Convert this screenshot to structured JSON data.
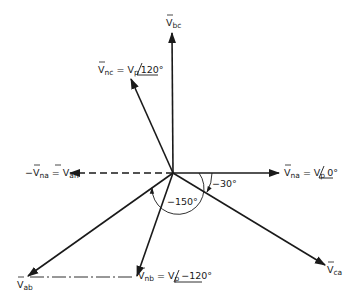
{
  "diagram": {
    "type": "phasor-diagram",
    "origin": {
      "x": 173,
      "y": 173
    },
    "colors": {
      "stroke": "#1a1a1a",
      "background": "#ffffff"
    },
    "phasors": [
      {
        "id": "V_bc",
        "base": "V",
        "sub": "bc",
        "suffix": "",
        "angle_text": "",
        "tip": {
          "x": 172,
          "y": 32
        },
        "style": "solid"
      },
      {
        "id": "V_nc",
        "base": "V",
        "sub": "nc",
        "suffix": " = V",
        "suffix_sub": "p",
        "angle_text": "120°",
        "tip": {
          "x": 130,
          "y": 78
        },
        "style": "solid"
      },
      {
        "id": "V_na",
        "base": "V",
        "sub": "na",
        "suffix": " = V",
        "suffix_sub": "p",
        "angle_text": "0°",
        "tip": {
          "x": 278,
          "y": 173
        },
        "style": "solid"
      },
      {
        "id": "V_an",
        "prefix": "−V",
        "prefix_sub": "na",
        "base": "V",
        "sub": "an",
        "eq": " = ",
        "tip": {
          "x": 70,
          "y": 173
        },
        "style": "dashed"
      },
      {
        "id": "V_ab",
        "base": "V",
        "sub": "ab",
        "tip": {
          "x": 27,
          "y": 277
        },
        "style": "solid"
      },
      {
        "id": "V_nb",
        "base": "V",
        "sub": "nb",
        "suffix": " = V",
        "suffix_sub": "p",
        "angle_text": "−120°",
        "tip": {
          "x": 136,
          "y": 277
        },
        "style": "solid"
      },
      {
        "id": "V_ca",
        "base": "V",
        "sub": "ca",
        "tip": {
          "x": 325,
          "y": 265
        },
        "style": "solid"
      }
    ],
    "construction_lines": [
      {
        "from": "V_ab",
        "to": "V_nb",
        "style": "dash-dot",
        "y": 277
      }
    ],
    "angle_annotations": [
      {
        "label": "−30°",
        "between": [
          "V_na",
          "V_ca"
        ]
      },
      {
        "label": "−150°",
        "between": [
          "V_na",
          "V_ab"
        ]
      }
    ],
    "labels": {
      "bc": {
        "main": "V",
        "sub": "bc"
      },
      "nc": {
        "main": "V",
        "sub": "nc",
        "eq": " = V",
        "eq_sub": "p",
        "angle": "120°"
      },
      "na": {
        "main": "V",
        "sub": "na",
        "eq": " = V",
        "eq_sub": "p",
        "angle": "0°"
      },
      "an": {
        "neg": "−V",
        "neg_sub": "na",
        "eq": " = V",
        "sub": "an"
      },
      "ab": {
        "main": "V",
        "sub": "ab"
      },
      "nb": {
        "main": "V",
        "sub": "nb",
        "eq": " = V",
        "eq_sub": "p",
        "angle": "−120°"
      },
      "ca": {
        "main": "V",
        "sub": "ca"
      },
      "angle_30": "−30°",
      "angle_150": "−150°"
    }
  }
}
